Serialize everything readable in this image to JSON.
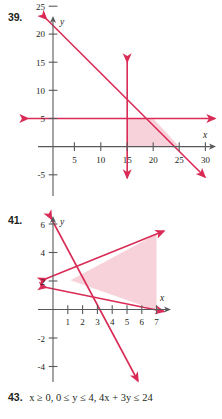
{
  "page": {
    "kind": "math-textbook-exercises",
    "accent_color": "#d92b55",
    "shade_color": "#f4b7c4",
    "axis_color": "#58595b",
    "text_color": "#231f20",
    "background": "#ffffff"
  },
  "problems": [
    {
      "number": "39.",
      "chart": {
        "type": "line",
        "title": "",
        "xlabel": "x",
        "ylabel": "y",
        "xlim": [
          -3,
          33
        ],
        "ylim": [
          -7,
          28
        ],
        "grid": false,
        "legend": "none",
        "x_ticks": [
          5,
          10,
          15,
          20,
          25,
          30
        ],
        "x_tick_labels": [
          "5",
          "10",
          "15",
          "20",
          "25",
          "30"
        ],
        "y_ticks": [
          -5,
          5,
          10,
          15,
          20,
          25
        ],
        "y_tick_labels": [
          "-5",
          "5",
          "10",
          "15",
          "20",
          "25"
        ],
        "series": [
          {
            "name": "diagonal-boundary",
            "kind": "line",
            "points": [
              [
                -1.5,
                26.5
              ],
              [
                30.5,
                -5.5
              ]
            ],
            "passes_through": [
              [
                0,
                25
              ],
              [
                25,
                0
              ]
            ],
            "arrows": [
              "start",
              "end"
            ]
          },
          {
            "name": "horizontal-boundary",
            "kind": "line",
            "points": [
              [
                -2.5,
                5
              ],
              [
                31.5,
                5
              ]
            ],
            "y_value": 5,
            "arrows": [
              "start",
              "end"
            ]
          },
          {
            "name": "vertical-boundary",
            "kind": "line",
            "points": [
              [
                15,
                15.5
              ],
              [
                15,
                -5.5
              ]
            ],
            "x_value": 15,
            "arrows": [
              "start",
              "end"
            ]
          }
        ],
        "shaded_region": {
          "name": "solution-region",
          "vertices": [
            [
              15,
              0
            ],
            [
              15,
              5
            ],
            [
              20,
              5
            ],
            [
              25,
              0
            ]
          ]
        }
      }
    },
    {
      "number": "41.",
      "chart": {
        "type": "line",
        "title": "",
        "xlabel": "x",
        "ylabel": "y",
        "xlim": [
          -0.6,
          7.8
        ],
        "ylim": [
          -5.2,
          9.0
        ],
        "grid": false,
        "legend": "none",
        "x_ticks": [
          1,
          2,
          3,
          4,
          5,
          6,
          7
        ],
        "x_tick_labels": [
          "1",
          "2",
          "3",
          "4",
          "5",
          "6",
          "7"
        ],
        "y_ticks": [
          -4,
          -2,
          2,
          4,
          6,
          8
        ],
        "y_tick_labels": [
          "-4",
          "-2",
          "2",
          "4",
          "6",
          "8"
        ],
        "series": [
          {
            "name": "rising-boundary",
            "kind": "line",
            "points": [
              [
                -0.35,
                3.85
              ],
              [
                7.35,
                8.2
              ]
            ],
            "passes_through": [
              [
                0,
                4
              ],
              [
                7,
                8
              ]
            ],
            "arrows": [
              "start",
              "end"
            ]
          },
          {
            "name": "shallow-falling-boundary",
            "kind": "line",
            "points": [
              [
                -0.35,
                3.2
              ],
              [
                7.35,
                -0.35
              ]
            ],
            "passes_through": [
              [
                0,
                3
              ],
              [
                6.4,
                0
              ]
            ],
            "arrows": [
              "start",
              "end"
            ]
          },
          {
            "name": "steep-falling-boundary",
            "kind": "line",
            "points": [
              [
                -0.1,
                8.5
              ],
              [
                4.3,
                -5.2
              ]
            ],
            "passes_through": [
              [
                0,
                8
              ],
              [
                2.6,
                0
              ]
            ],
            "arrows": [
              "start",
              "end"
            ]
          }
        ],
        "shaded_region": {
          "name": "solution-region",
          "vertices": [
            [
              2.25,
              1.9
            ],
            [
              7,
              8.05
            ],
            [
              7,
              7.95
            ],
            [
              7,
              -0.2
            ]
          ]
        }
      }
    }
  ],
  "text_exercise": {
    "number": "43.",
    "expression": "x ≥ 0, 0 ≤ y ≤ 4, 4x + 3y ≤ 24",
    "parts": [
      {
        "var": "x",
        "rest": " ≥ 0, 0 ≤ "
      },
      {
        "var": "y",
        "rest": " ≤ 4, 4"
      },
      {
        "var": "x",
        "rest": " + 3"
      },
      {
        "var": "y",
        "rest": " ≤ 24"
      }
    ]
  }
}
